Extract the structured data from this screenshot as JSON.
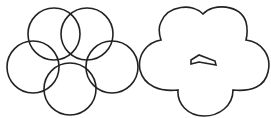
{
  "diagram": {
    "stroke_color": "#222222",
    "background": "#ffffff",
    "left_figure": {
      "description": "five overlapping circles",
      "circles": [
        {
          "cx": 54,
          "cy": 34,
          "r": 26
        },
        {
          "cx": 87,
          "cy": 34,
          "r": 26
        },
        {
          "cx": 33,
          "cy": 67,
          "r": 26
        },
        {
          "cx": 112,
          "cy": 67,
          "r": 26
        },
        {
          "cx": 70,
          "cy": 89,
          "r": 26
        }
      ]
    },
    "right_figure": {
      "description": "union outline of five circles (cloud shape) with small chevron in center"
    }
  }
}
